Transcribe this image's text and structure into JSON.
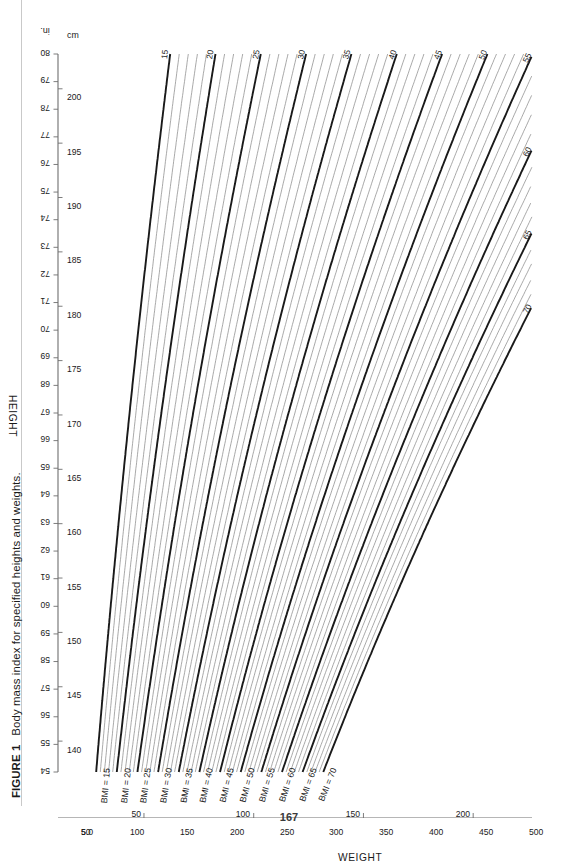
{
  "caption": {
    "figure_number": "FIGURE 1",
    "text": "Body mass index for specified heights and weights."
  },
  "page_number": "167",
  "colors": {
    "line_major": "#1a1a1a",
    "line_minor": "#8c8c8c",
    "axis": "#6e6e6e",
    "text": "#1a1a1a",
    "page_rule": "#c9c9c9"
  },
  "chart_data": {
    "type": "line",
    "title": "Body mass index for specified heights and weights.",
    "xlabel": "HEIGHT",
    "ylabel": "WEIGHT",
    "x_units": {
      "primary": "in.",
      "secondary": "cm"
    },
    "y_units": {
      "primary": "lb",
      "secondary": "kg"
    },
    "xlim_in": [
      54,
      80
    ],
    "ylim_lb": [
      50,
      500
    ],
    "grid": false,
    "legend": "none",
    "x_ticks_in": [
      54,
      55,
      56,
      57,
      58,
      59,
      60,
      61,
      62,
      63,
      64,
      65,
      66,
      67,
      68,
      69,
      70,
      71,
      72,
      73,
      74,
      75,
      76,
      77,
      78,
      79,
      80
    ],
    "x_ticks_cm_labeled": [
      135,
      140,
      145,
      150,
      155,
      160,
      165,
      170,
      175,
      180,
      185,
      190,
      195,
      200
    ],
    "y_ticks_lb_labeled": [
      50,
      100,
      150,
      200,
      250,
      300,
      350,
      400,
      450,
      500
    ],
    "y_ticks_lb_minor": [
      75,
      125,
      175,
      225,
      275,
      325,
      375,
      425,
      475
    ],
    "y_ticks_kg_labeled": [
      50,
      100,
      150,
      200
    ],
    "series": [
      {
        "name": "BMI = 15",
        "bmi": 15,
        "label_left": "BMI = 15",
        "label_right": "15",
        "weight": "major"
      },
      {
        "name": "BMI = 16",
        "bmi": 16,
        "label_left": "",
        "label_right": "",
        "weight": "minor"
      },
      {
        "name": "BMI = 17",
        "bmi": 17,
        "label_left": "",
        "label_right": "",
        "weight": "minor"
      },
      {
        "name": "BMI = 18",
        "bmi": 18,
        "label_left": "",
        "label_right": "",
        "weight": "minor"
      },
      {
        "name": "BMI = 19",
        "bmi": 19,
        "label_left": "",
        "label_right": "",
        "weight": "minor"
      },
      {
        "name": "BMI = 20",
        "bmi": 20,
        "label_left": "BMI = 20",
        "label_right": "20",
        "weight": "major"
      },
      {
        "name": "BMI = 21",
        "bmi": 21,
        "label_left": "",
        "label_right": "",
        "weight": "minor"
      },
      {
        "name": "BMI = 22",
        "bmi": 22,
        "label_left": "",
        "label_right": "",
        "weight": "minor"
      },
      {
        "name": "BMI = 23",
        "bmi": 23,
        "label_left": "",
        "label_right": "",
        "weight": "minor"
      },
      {
        "name": "BMI = 24",
        "bmi": 24,
        "label_left": "",
        "label_right": "",
        "weight": "minor"
      },
      {
        "name": "BMI = 25",
        "bmi": 25,
        "label_left": "BMI = 25",
        "label_right": "25",
        "weight": "major"
      },
      {
        "name": "BMI = 26",
        "bmi": 26,
        "label_left": "",
        "label_right": "",
        "weight": "minor"
      },
      {
        "name": "BMI = 27",
        "bmi": 27,
        "label_left": "",
        "label_right": "",
        "weight": "minor"
      },
      {
        "name": "BMI = 28",
        "bmi": 28,
        "label_left": "",
        "label_right": "",
        "weight": "minor"
      },
      {
        "name": "BMI = 29",
        "bmi": 29,
        "label_left": "",
        "label_right": "",
        "weight": "minor"
      },
      {
        "name": "BMI = 30",
        "bmi": 30,
        "label_left": "BMI = 30",
        "label_right": "30",
        "weight": "major"
      },
      {
        "name": "BMI = 31",
        "bmi": 31,
        "label_left": "",
        "label_right": "",
        "weight": "minor"
      },
      {
        "name": "BMI = 32",
        "bmi": 32,
        "label_left": "",
        "label_right": "",
        "weight": "minor"
      },
      {
        "name": "BMI = 33",
        "bmi": 33,
        "label_left": "",
        "label_right": "",
        "weight": "minor"
      },
      {
        "name": "BMI = 34",
        "bmi": 34,
        "label_left": "",
        "label_right": "",
        "weight": "minor"
      },
      {
        "name": "BMI = 35",
        "bmi": 35,
        "label_left": "BMI = 35",
        "label_right": "35",
        "weight": "major"
      },
      {
        "name": "BMI = 36",
        "bmi": 36,
        "label_left": "",
        "label_right": "",
        "weight": "minor"
      },
      {
        "name": "BMI = 37",
        "bmi": 37,
        "label_left": "",
        "label_right": "",
        "weight": "minor"
      },
      {
        "name": "BMI = 38",
        "bmi": 38,
        "label_left": "",
        "label_right": "",
        "weight": "minor"
      },
      {
        "name": "BMI = 39",
        "bmi": 39,
        "label_left": "",
        "label_right": "",
        "weight": "minor"
      },
      {
        "name": "BMI = 40",
        "bmi": 40,
        "label_left": "BMI = 40",
        "label_right": "40",
        "weight": "major"
      },
      {
        "name": "BMI = 41",
        "bmi": 41,
        "label_left": "",
        "label_right": "",
        "weight": "minor"
      },
      {
        "name": "BMI = 42",
        "bmi": 42,
        "label_left": "",
        "label_right": "",
        "weight": "minor"
      },
      {
        "name": "BMI = 43",
        "bmi": 43,
        "label_left": "",
        "label_right": "",
        "weight": "minor"
      },
      {
        "name": "BMI = 44",
        "bmi": 44,
        "label_left": "",
        "label_right": "",
        "weight": "minor"
      },
      {
        "name": "BMI = 45",
        "bmi": 45,
        "label_left": "BMI = 45",
        "label_right": "45",
        "weight": "major"
      },
      {
        "name": "BMI = 46",
        "bmi": 46,
        "label_left": "",
        "label_right": "",
        "weight": "minor"
      },
      {
        "name": "BMI = 47",
        "bmi": 47,
        "label_left": "",
        "label_right": "",
        "weight": "minor"
      },
      {
        "name": "BMI = 48",
        "bmi": 48,
        "label_left": "",
        "label_right": "",
        "weight": "minor"
      },
      {
        "name": "BMI = 49",
        "bmi": 49,
        "label_left": "",
        "label_right": "",
        "weight": "minor"
      },
      {
        "name": "BMI = 50",
        "bmi": 50,
        "label_left": "BMI = 50",
        "label_right": "50",
        "weight": "major"
      },
      {
        "name": "BMI = 51",
        "bmi": 51,
        "label_left": "",
        "label_right": "",
        "weight": "minor"
      },
      {
        "name": "BMI = 52",
        "bmi": 52,
        "label_left": "",
        "label_right": "",
        "weight": "minor"
      },
      {
        "name": "BMI = 53",
        "bmi": 53,
        "label_left": "",
        "label_right": "",
        "weight": "minor"
      },
      {
        "name": "BMI = 54",
        "bmi": 54,
        "label_left": "",
        "label_right": "",
        "weight": "minor"
      },
      {
        "name": "BMI = 55",
        "bmi": 55,
        "label_left": "BMI = 55",
        "label_right": "55",
        "weight": "major"
      },
      {
        "name": "BMI = 56",
        "bmi": 56,
        "label_left": "",
        "label_right": "",
        "weight": "minor"
      },
      {
        "name": "BMI = 57",
        "bmi": 57,
        "label_left": "",
        "label_right": "",
        "weight": "minor"
      },
      {
        "name": "BMI = 58",
        "bmi": 58,
        "label_left": "",
        "label_right": "",
        "weight": "minor"
      },
      {
        "name": "BMI = 59",
        "bmi": 59,
        "label_left": "",
        "label_right": "",
        "weight": "minor"
      },
      {
        "name": "BMI = 60",
        "bmi": 60,
        "label_left": "BMI = 60",
        "label_right": "60",
        "weight": "major"
      },
      {
        "name": "BMI = 61",
        "bmi": 61,
        "label_left": "",
        "label_right": "",
        "weight": "minor"
      },
      {
        "name": "BMI = 62",
        "bmi": 62,
        "label_left": "",
        "label_right": "",
        "weight": "minor"
      },
      {
        "name": "BMI = 63",
        "bmi": 63,
        "label_left": "",
        "label_right": "",
        "weight": "minor"
      },
      {
        "name": "BMI = 64",
        "bmi": 64,
        "label_left": "",
        "label_right": "",
        "weight": "minor"
      },
      {
        "name": "BMI = 65",
        "bmi": 65,
        "label_left": "BMI = 65",
        "label_right": "65",
        "weight": "major"
      },
      {
        "name": "BMI = 66",
        "bmi": 66,
        "label_left": "",
        "label_right": "",
        "weight": "minor"
      },
      {
        "name": "BMI = 67",
        "bmi": 67,
        "label_left": "",
        "label_right": "",
        "weight": "minor"
      },
      {
        "name": "BMI = 68",
        "bmi": 68,
        "label_left": "",
        "label_right": "",
        "weight": "minor"
      },
      {
        "name": "BMI = 69",
        "bmi": 69,
        "label_left": "",
        "label_right": "",
        "weight": "minor"
      },
      {
        "name": "BMI = 70",
        "bmi": 70,
        "label_left": "BMI = 70",
        "label_right": "70",
        "weight": "major"
      }
    ]
  }
}
